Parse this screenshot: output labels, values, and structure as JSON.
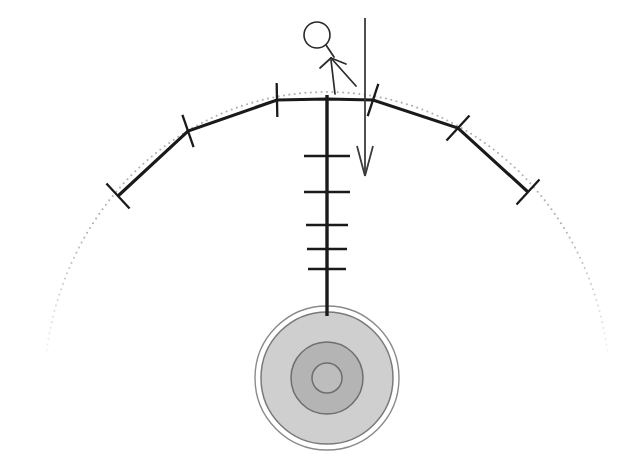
{
  "canvas": {
    "width": 633,
    "height": 471,
    "background": "#ffffff",
    "title": "Deflected curved beam with hanging concentric disc load and applied downward force"
  },
  "colors": {
    "stroke_dark": "#1a1a1a",
    "stroke_medium": "#3c3c3c",
    "dotted_arc": "#b0b0b0",
    "disc_outer_ring_fill": "#ffffff",
    "disc_outer_fill": "#cfcfcf",
    "disc_middle_fill": "#b4b4b4",
    "disc_inner_fill": "#bdbdbd",
    "disc_stroke": "#6e6e6e"
  },
  "elements": {
    "dotted_arc": {
      "name": "reference-arc",
      "style": "dotted",
      "color": "#b0b0b0",
      "dot_radius": 1.05,
      "dot_count": 150,
      "center_x": 327,
      "center_y": 392,
      "radius_x": 283,
      "radius_y": 300,
      "start_angle_deg": 188,
      "end_angle_deg": 352
    },
    "polyline": {
      "name": "segmented-beam",
      "stroke_width": 3.1,
      "color": "#1a1a1a",
      "points": [
        {
          "x": 118,
          "y": 196
        },
        {
          "x": 188,
          "y": 131
        },
        {
          "x": 277,
          "y": 100
        },
        {
          "x": 327,
          "y": 99
        },
        {
          "x": 373,
          "y": 100
        },
        {
          "x": 458,
          "y": 128
        },
        {
          "x": 528,
          "y": 192
        }
      ]
    },
    "joint_ticks": [
      {
        "name": "joint-tick-1",
        "x": 118,
        "y": 196,
        "angle_deg": -42.9,
        "length": 34
      },
      {
        "name": "joint-tick-2",
        "x": 188,
        "y": 131,
        "angle_deg": -19.2,
        "length": 34
      },
      {
        "name": "joint-tick-3",
        "x": 277,
        "y": 100,
        "angle_deg": -1.1,
        "length": 34
      },
      {
        "name": "joint-tick-4",
        "x": 373,
        "y": 100,
        "angle_deg": 18.3,
        "length": 34
      },
      {
        "name": "joint-tick-5",
        "x": 458,
        "y": 128,
        "angle_deg": 42.5,
        "length": 34
      },
      {
        "name": "joint-tick-6",
        "x": 528,
        "y": 192,
        "angle_deg": 42.5,
        "length": 34
      }
    ],
    "vertical_member": {
      "name": "vertical-hanger",
      "x": 327,
      "y_top": 95,
      "y_bottom": 316,
      "stroke_width": 3.4,
      "color": "#1a1a1a"
    },
    "ladder_rungs": [
      {
        "name": "rung-1",
        "y": 156,
        "half_width": 23
      },
      {
        "name": "rung-2",
        "y": 192,
        "half_width": 23
      },
      {
        "name": "rung-3",
        "y": 225,
        "half_width": 21
      },
      {
        "name": "rung-4",
        "y": 249,
        "half_width": 20
      },
      {
        "name": "rung-5",
        "y": 269,
        "half_width": 19
      }
    ],
    "disc_assembly": {
      "name": "concentric-disc-weight",
      "center_x": 327,
      "center_y": 378,
      "rings": [
        {
          "name": "disc-ring-outer-edge",
          "radius": 72,
          "fill": "#ffffff",
          "stroke": "#8a8a8a",
          "stroke_width": 1.4
        },
        {
          "name": "disc-ring-outer",
          "radius": 66,
          "fill": "#cfcfcf",
          "stroke": "#7a7a7a",
          "stroke_width": 1.5
        },
        {
          "name": "disc-ring-middle",
          "radius": 36,
          "fill": "#b4b4b4",
          "stroke": "#6e6e6e",
          "stroke_width": 1.5
        },
        {
          "name": "disc-ring-inner",
          "radius": 15,
          "fill": "#bdbdbd",
          "stroke": "#6e6e6e",
          "stroke_width": 1.5
        }
      ]
    },
    "force_arrow": {
      "name": "applied-force-arrow",
      "x": 365,
      "y_top": 18,
      "y_tip": 176,
      "head_half_width": 8,
      "head_length": 30,
      "stroke_width": 1.8,
      "color": "#3c3c3c"
    },
    "stick_figure": {
      "name": "stick-figure-operator",
      "head": {
        "cx": 317,
        "cy": 35,
        "r": 13,
        "stroke_width": 1.6
      },
      "neck": {
        "x1": 326,
        "y1": 45,
        "x2": 334,
        "y2": 57
      },
      "pointer_arrow": {
        "shaft": {
          "x1": 356,
          "y1": 86,
          "x2": 331,
          "y2": 58
        },
        "barb_left": {
          "x1": 331,
          "y1": 58,
          "x2": 320,
          "y2": 68
        },
        "barb_right": {
          "x1": 331,
          "y1": 58,
          "x2": 346,
          "y2": 64
        },
        "extra_leg": {
          "x1": 331,
          "y1": 60,
          "x2": 335,
          "y2": 94
        }
      }
    }
  }
}
